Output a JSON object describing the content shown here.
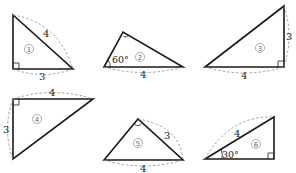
{
  "diagram": {
    "triangles": [
      {
        "id": "1",
        "label": "①",
        "number": "1",
        "right_angle_at": "bottom-left",
        "sides": {
          "hypotenuse": "4",
          "bottom": "3"
        },
        "angle": null
      },
      {
        "id": "2",
        "label": "②",
        "number": "2",
        "right_angle_at": "top",
        "sides": {
          "bottom": "4"
        },
        "angle": "60°"
      },
      {
        "id": "3",
        "label": "③",
        "number": "3",
        "right_angle_at": "bottom-right",
        "sides": {
          "right": "3",
          "bottom": "4"
        },
        "angle": null
      },
      {
        "id": "4",
        "label": "④",
        "number": "4",
        "right_angle_at": "top-left",
        "sides": {
          "top": "4",
          "left": "3"
        },
        "angle": null
      },
      {
        "id": "5",
        "label": "⑤",
        "number": "5",
        "right_angle_at": "top",
        "sides": {
          "right": "3",
          "bottom": "4"
        },
        "angle": null
      },
      {
        "id": "6",
        "label": "⑥",
        "number": "6",
        "right_angle_at": "bottom-right",
        "sides": {
          "hypotenuse": "4"
        },
        "angle": "30°"
      }
    ]
  }
}
